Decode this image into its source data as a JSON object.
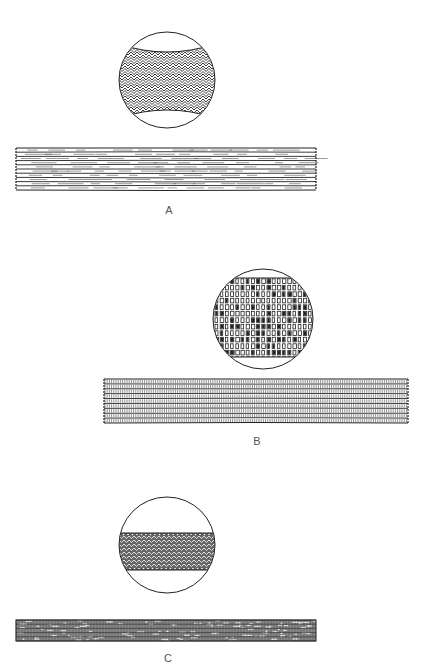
{
  "figures": [
    {
      "id": "A",
      "label": "A",
      "label_pos": [
        169,
        210
      ],
      "circle": {
        "cx": 167,
        "cy": 80,
        "r": 48,
        "pattern": "herringbone",
        "band_top": 52,
        "band_bottom": 110,
        "curve": 8
      },
      "band": {
        "x": 16,
        "y": 148,
        "w": 300,
        "h": 42,
        "pattern": "plain-lines",
        "rows": 10
      }
    },
    {
      "id": "B",
      "label": "B",
      "label_pos": [
        257,
        441
      ],
      "circle": {
        "cx": 263,
        "cy": 319,
        "r": 50,
        "pattern": "blocks",
        "band_top": 278,
        "band_bottom": 357,
        "curve": 0
      },
      "band": {
        "x": 104,
        "y": 379,
        "w": 304,
        "h": 44,
        "pattern": "ticked-lines",
        "rows": 9
      }
    },
    {
      "id": "C",
      "label": "C",
      "label_pos": [
        168,
        658
      ],
      "circle": {
        "cx": 167,
        "cy": 545,
        "r": 48,
        "pattern": "dense-weave",
        "band_top": 533,
        "band_bottom": 570,
        "curve": 0
      },
      "band": {
        "x": 16,
        "y": 620,
        "w": 300,
        "h": 21,
        "pattern": "dense-weave",
        "rows": 5
      }
    }
  ],
  "colors": {
    "ink": "#222222",
    "label": "#555555",
    "background": "#ffffff"
  }
}
